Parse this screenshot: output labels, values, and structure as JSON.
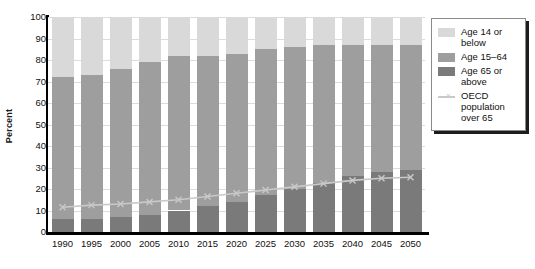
{
  "chart_data": {
    "type": "bar",
    "stacked": true,
    "title": "",
    "xlabel": "",
    "ylabel": "Percent",
    "ylim": [
      0,
      100
    ],
    "yticks": [
      0,
      10,
      20,
      30,
      40,
      50,
      60,
      70,
      80,
      90,
      100
    ],
    "grid": true,
    "legend_position": "right",
    "categories": [
      "1990",
      "1995",
      "2000",
      "2005",
      "2010",
      "2015",
      "2020",
      "2025",
      "2030",
      "2035",
      "2040",
      "2045",
      "2050"
    ],
    "series": [
      {
        "name": "Age 65 or above",
        "color": "#7a7a7a",
        "values": [
          6,
          6,
          7,
          8,
          10,
          12,
          14,
          17,
          20,
          23,
          26,
          28,
          29
        ]
      },
      {
        "name": "Age 15-64",
        "color": "#9e9e9e",
        "values": [
          66,
          67,
          69,
          71,
          72,
          70,
          69,
          68,
          66,
          64,
          61,
          59,
          58
        ]
      },
      {
        "name": "Age 14 or below",
        "color": "#d9d9d9",
        "values": [
          28,
          27,
          24,
          21,
          18,
          18,
          17,
          15,
          14,
          13,
          13,
          13,
          13
        ]
      }
    ],
    "stack_tops": {
      "age_65_above": [
        6,
        6,
        7,
        8,
        10,
        12,
        14,
        17,
        20,
        23,
        26,
        28,
        29
      ],
      "age_15_64": [
        72,
        73,
        76,
        79,
        82,
        82,
        83,
        85,
        86,
        87,
        87,
        87,
        87
      ],
      "age_14_below": [
        100,
        100,
        100,
        100,
        100,
        100,
        100,
        100,
        100,
        100,
        100,
        100,
        100
      ]
    },
    "line_series": {
      "name": "OECD population over 65",
      "color": "#c9c9c9",
      "marker": "x",
      "values": [
        11.5,
        12.5,
        13,
        14,
        15,
        16.5,
        18,
        19.5,
        21,
        22.5,
        24,
        25,
        25.5
      ]
    }
  },
  "legend": {
    "items": [
      {
        "label": "Age 14 or below",
        "type": "swatch",
        "color": "#d9d9d9"
      },
      {
        "label": "Age 15–64",
        "type": "swatch",
        "color": "#9e9e9e"
      },
      {
        "label": "Age 65 or above",
        "type": "swatch",
        "color": "#7a7a7a"
      },
      {
        "label": "OECD population over 65",
        "type": "line",
        "color": "#c9c9c9",
        "marker": "×"
      }
    ]
  },
  "axes": {
    "y_title": "Percent"
  }
}
